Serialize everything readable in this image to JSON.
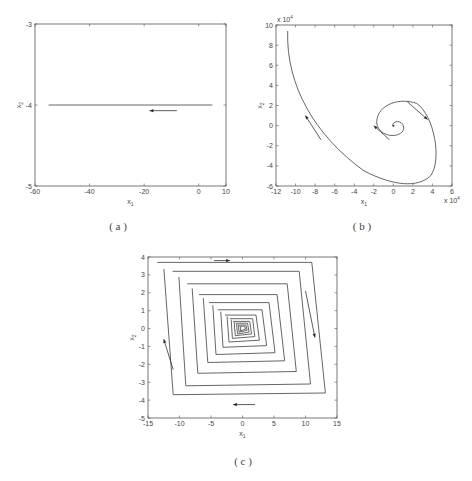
{
  "chart_data": [
    {
      "id": "a",
      "type": "line",
      "caption": "( a )",
      "xlabel": "x1",
      "ylabel": "x2",
      "xlim": [
        -60,
        10
      ],
      "ylim": [
        -5,
        -3
      ],
      "xticks": [
        -60,
        -40,
        -20,
        0,
        10
      ],
      "yticks": [
        -5,
        -4,
        -3
      ],
      "grid": false,
      "series": [
        {
          "name": "trajectory",
          "x": [
            5,
            -55
          ],
          "y": [
            -4,
            -4
          ]
        }
      ],
      "arrows": [
        {
          "from": [
            -8,
            -4.07
          ],
          "to": [
            -18,
            -4.07
          ],
          "direction": "left"
        }
      ]
    },
    {
      "id": "b",
      "type": "line",
      "caption": "( b )",
      "xlabel": "x1",
      "ylabel": "x2",
      "x_multiplier": "x 10^4",
      "y_multiplier": "x 10^4",
      "xlim": [
        -12,
        6
      ],
      "ylim": [
        -6,
        10
      ],
      "xticks": [
        -12,
        -10,
        -8,
        -6,
        -4,
        -2,
        0,
        2,
        4,
        6
      ],
      "yticks": [
        -6,
        -4,
        -2,
        0,
        2,
        4,
        6,
        8,
        10
      ],
      "grid": false,
      "series": [
        {
          "name": "spiral trajectory",
          "description": "starts near (-10.8, 9.4), sweeps down-right to (1.5, -5.8), loops up around to (4.3, -4), (2, 2), (-1.5, 2), then spirals inward to origin",
          "x": [
            -10.8,
            -10.5,
            -8,
            -4,
            0,
            2,
            4,
            4.3,
            3.5,
            1.5,
            -1,
            -1.8,
            -1,
            0.5,
            1,
            0.2,
            0
          ],
          "y": [
            9.4,
            5,
            0.5,
            -3.5,
            -5.5,
            -5.7,
            -3.5,
            -1,
            1.5,
            2.3,
            1.8,
            0,
            -1,
            -0.8,
            0.3,
            0.2,
            0
          ]
        }
      ],
      "arrows": [
        {
          "at": [
            -9,
            0.8
          ],
          "direction": "up-left"
        },
        {
          "at": [
            3.4,
            0.6
          ],
          "direction": "down-right"
        },
        {
          "at": [
            -1.8,
            0
          ],
          "direction": "up-left"
        }
      ]
    },
    {
      "id": "c",
      "type": "line",
      "caption": "( c )",
      "xlabel": "x1",
      "ylabel": "x2",
      "xlim": [
        -15,
        15
      ],
      "ylim": [
        -5,
        4
      ],
      "xticks": [
        -15,
        -10,
        -5,
        0,
        5,
        10,
        15
      ],
      "yticks": [
        -5,
        -4,
        -3,
        -2,
        -1,
        0,
        1,
        2,
        3,
        4
      ],
      "grid": false,
      "series": [
        {
          "name": "converging rhombic trajectory",
          "description": "nested parallelogram loops spiralling clockwise inward to origin",
          "loops": [
            {
              "half_width": 12.8,
              "half_height": 3.7,
              "skew": 1.8
            },
            {
              "half_width": 10.5,
              "half_height": 3.2,
              "skew": 1.5
            },
            {
              "half_width": 8.3,
              "half_height": 2.5,
              "skew": 1.2
            },
            {
              "half_width": 6.5,
              "half_height": 1.9,
              "skew": 1.0
            },
            {
              "half_width": 5.0,
              "half_height": 1.45,
              "skew": 0.8
            },
            {
              "half_width": 3.7,
              "half_height": 1.05,
              "skew": 0.6
            },
            {
              "half_width": 2.6,
              "half_height": 0.75,
              "skew": 0.45
            },
            {
              "half_width": 1.9,
              "half_height": 0.55,
              "skew": 0.3
            },
            {
              "half_width": 1.4,
              "half_height": 0.4,
              "skew": 0.25
            },
            {
              "half_width": 1.0,
              "half_height": 0.3,
              "skew": 0.2
            },
            {
              "half_width": 0.7,
              "half_height": 0.2,
              "skew": 0.15
            },
            {
              "half_width": 0.45,
              "half_height": 0.13,
              "skew": 0.1
            }
          ]
        }
      ],
      "arrows": [
        {
          "at": [
            -2,
            3.8
          ],
          "direction": "right"
        },
        {
          "at": [
            11,
            -0.5
          ],
          "direction": "down"
        },
        {
          "at": [
            -12.5,
            -1
          ],
          "direction": "up"
        },
        {
          "at": [
            0,
            -4.2
          ],
          "direction": "left"
        }
      ]
    }
  ],
  "labels": {
    "a": {
      "caption": "( a )",
      "x": "x",
      "x_sub": "1",
      "y": "x",
      "y_sub": "2"
    },
    "b": {
      "caption": "( b )",
      "x": "x",
      "x_sub": "1",
      "y": "x",
      "y_sub": "2",
      "mult": "x 10",
      "mult_exp": "4"
    },
    "c": {
      "caption": "( c )",
      "x": "x",
      "x_sub": "1",
      "y": "x",
      "y_sub": "2"
    }
  }
}
